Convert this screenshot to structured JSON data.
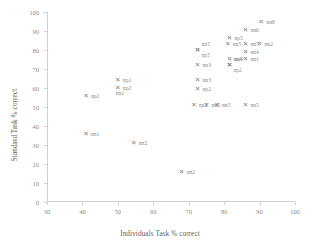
{
  "chart_data": {
    "type": "scatter",
    "title": "",
    "xlabel": "Individuals Task % correct",
    "ylabel": "Standard Task % correct",
    "xlim": [
      30,
      100
    ],
    "ylim": [
      0,
      100
    ],
    "xticks": [
      30,
      40,
      50,
      60,
      70,
      80,
      90,
      100
    ],
    "yticks": [
      0,
      10,
      20,
      30,
      40,
      50,
      60,
      70,
      80,
      90,
      100
    ],
    "grid": false,
    "legend": "none",
    "marker": "x",
    "marker_color": "#7f7f7f",
    "points": [
      {
        "label": "nn8",
        "x": 90.5,
        "y": 94.5,
        "pos": "right"
      },
      {
        "label": "nn6",
        "x": 86.0,
        "y": 90.5,
        "pos": "right"
      },
      {
        "label": "np5",
        "x": 81.5,
        "y": 86.0,
        "pos": "right"
      },
      {
        "label": "nn5",
        "x": 81.0,
        "y": 83.0,
        "pos": "right"
      },
      {
        "label": "nn7",
        "x": 86.0,
        "y": 83.0,
        "pos": "right"
      },
      {
        "label": "nn2",
        "x": 90.0,
        "y": 83.0,
        "pos": "right"
      },
      {
        "label": "nn4",
        "x": 86.0,
        "y": 79.0,
        "pos": "right"
      },
      {
        "label": "nn5",
        "x": 72.5,
        "y": 80.0,
        "pos": "above"
      },
      {
        "label": "np5",
        "x": 72.5,
        "y": 80.0,
        "pos": "below"
      },
      {
        "label": "np3",
        "x": 81.5,
        "y": 75.0,
        "pos": "right"
      },
      {
        "label": "nn1",
        "x": 86.0,
        "y": 75.0,
        "pos": "right"
      },
      {
        "label": "nn4",
        "x": 81.5,
        "y": 72.0,
        "pos": "above"
      },
      {
        "label": "np2",
        "x": 81.5,
        "y": 72.0,
        "pos": "below"
      },
      {
        "label": "nn3",
        "x": 72.5,
        "y": 72.0,
        "pos": "right"
      },
      {
        "label": "nn3",
        "x": 72.5,
        "y": 64.0,
        "pos": "right"
      },
      {
        "label": "np1",
        "x": 50.0,
        "y": 64.0,
        "pos": "right"
      },
      {
        "label": "np2",
        "x": 50.0,
        "y": 60.0,
        "pos": "right"
      },
      {
        "label": "nn1",
        "x": 50.0,
        "y": 57.5,
        "pos": "label-only"
      },
      {
        "label": "np2",
        "x": 72.5,
        "y": 59.5,
        "pos": "right"
      },
      {
        "label": "np2",
        "x": 41.0,
        "y": 55.5,
        "pos": "right"
      },
      {
        "label": "np2",
        "x": 71.5,
        "y": 51.0,
        "pos": "right"
      },
      {
        "label": "nn5",
        "x": 75.0,
        "y": 51.0,
        "pos": "right"
      },
      {
        "label": "nn5",
        "x": 78.0,
        "y": 51.0,
        "pos": "right"
      },
      {
        "label": "nn5",
        "x": 86.0,
        "y": 51.0,
        "pos": "right"
      },
      {
        "label": "nn1",
        "x": 41.0,
        "y": 35.5,
        "pos": "right"
      },
      {
        "label": "nn2",
        "x": 54.5,
        "y": 31.0,
        "pos": "right"
      },
      {
        "label": "nn2",
        "x": 68.0,
        "y": 15.5,
        "pos": "right"
      }
    ]
  }
}
